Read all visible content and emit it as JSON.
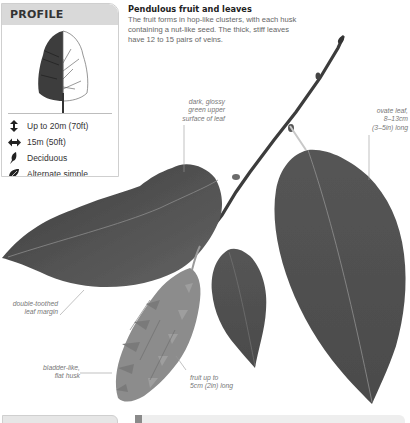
{
  "profile": {
    "title": "PROFILE",
    "tree_icon": "tree-silhouette-icon",
    "facts": [
      {
        "icon": "height-arrows-icon",
        "text": "Up to 20m (70ft)"
      },
      {
        "icon": "width-arrows-icon",
        "text": "15m (50ft)"
      },
      {
        "icon": "deciduous-leaf-icon",
        "text": "Deciduous"
      },
      {
        "icon": "leaf-arrangement-icon",
        "text": "Alternate simple"
      },
      {
        "icon": "globe-icon",
        "text": "S. Europe, W. Asia"
      }
    ]
  },
  "intro": {
    "title": "Pendulous fruit and leaves",
    "body": "The fruit forms in hop-like clusters, with each husk containing a nut-like seed. The thick, stiff leaves have 12 to 15 pairs of veins."
  },
  "annotations": {
    "glossy_surface": [
      "dark, glossy",
      "green upper",
      "surface of leaf"
    ],
    "ovate_leaf": [
      "ovate leaf,",
      "8–13cm",
      "(3–5in) long"
    ],
    "leaf_margin": [
      "double-toothed",
      "leaf margin"
    ],
    "husk": [
      "bladder-like,",
      "flat husk"
    ],
    "fruit_length": [
      "fruit up to",
      "5cm (2in) long"
    ]
  },
  "colors": {
    "header_bg": "#d9d9d9",
    "leaf_dark": "#4a4a4a",
    "leaf_mid": "#5e5e5e",
    "twig": "#3c3c3c",
    "husk": "#8a8a8a",
    "annotation_text": "#777777"
  }
}
